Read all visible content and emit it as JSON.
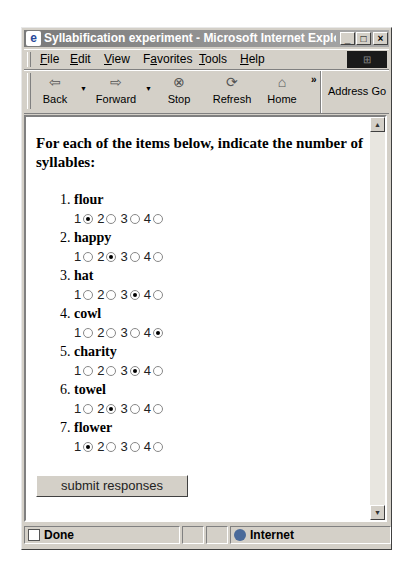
{
  "window": {
    "title": "Syllabification experiment - Microsoft Internet Explorer",
    "controls": {
      "minimize": "_",
      "maximize": "□",
      "close": "×"
    }
  },
  "menu": [
    {
      "label": "File",
      "accel": "F",
      "rest": "ile"
    },
    {
      "label": "Edit",
      "accel": "E",
      "rest": "dit"
    },
    {
      "label": "View",
      "accel": "V",
      "rest": "iew"
    },
    {
      "label": "Favorites",
      "pre": "F",
      "accel": "a",
      "rest": "vorites"
    },
    {
      "label": "Tools",
      "accel": "T",
      "rest": "ools"
    },
    {
      "label": "Help",
      "accel": "H",
      "rest": "elp"
    }
  ],
  "toolbar": {
    "back": {
      "label": "Back",
      "icon": "⇦"
    },
    "forward": {
      "label": "Forward",
      "icon": "⇨"
    },
    "stop": {
      "label": "Stop",
      "icon": "⊗"
    },
    "refresh": {
      "label": "Refresh",
      "icon": "⟳"
    },
    "home": {
      "label": "Home",
      "icon": "⌂"
    },
    "more": "»",
    "address_label": "Address Go"
  },
  "page": {
    "intro": "For each of the items below, indicate the number of syllables:",
    "options": [
      "1",
      "2",
      "3",
      "4"
    ],
    "items": [
      {
        "num": "1.",
        "word": "flour",
        "selected": "1"
      },
      {
        "num": "2.",
        "word": "happy",
        "selected": "2"
      },
      {
        "num": "3.",
        "word": "hat",
        "selected": "3"
      },
      {
        "num": "4.",
        "word": "cowl",
        "selected": "4"
      },
      {
        "num": "5.",
        "word": "charity",
        "selected": "3"
      },
      {
        "num": "6.",
        "word": "towel",
        "selected": "2"
      },
      {
        "num": "7.",
        "word": "flower",
        "selected": "1"
      }
    ],
    "submit_label": "submit responses"
  },
  "status": {
    "text": "Done",
    "zone": "Internet"
  }
}
